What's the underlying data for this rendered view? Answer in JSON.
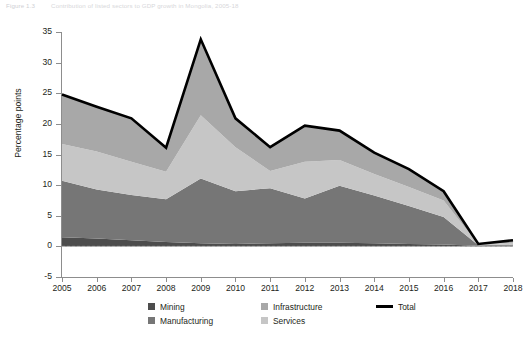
{
  "caption": {
    "number": "Figure 1.3",
    "text": "Contribution of listed sectors to GDP growth in Mongolia, 2005-18"
  },
  "chart_data": {
    "type": "area",
    "title": "",
    "subtitle": "",
    "xlabel": "",
    "ylabel": "Percentage points",
    "x": [
      2005,
      2006,
      2007,
      2008,
      2009,
      2010,
      2011,
      2012,
      2013,
      2014,
      2015,
      2016,
      2017,
      2018
    ],
    "categories": [
      "2005",
      "2006",
      "2007",
      "2008",
      "2009",
      "2010",
      "2011",
      "2012",
      "2013",
      "2014",
      "2015",
      "2016",
      "2017",
      "2018"
    ],
    "xlim": [
      2005,
      2018
    ],
    "ylim": [
      -5,
      35
    ],
    "yticks": [
      -5,
      0,
      5,
      10,
      15,
      20,
      25,
      30,
      35
    ],
    "grid": false,
    "stacked": true,
    "legend_position": "bottom",
    "series": [
      {
        "name": "Mining",
        "color": "#4d4d4d",
        "type": "area",
        "values": [
          1.5,
          1.3,
          1.0,
          0.7,
          0.5,
          0.4,
          0.5,
          0.6,
          0.6,
          0.5,
          0.4,
          0.3,
          0.1,
          0.1
        ]
      },
      {
        "name": "Manufacturing",
        "color": "#767676",
        "type": "area",
        "values": [
          9.2,
          8.0,
          7.4,
          7.0,
          10.6,
          8.6,
          9.0,
          7.2,
          9.3,
          7.8,
          6.2,
          4.5,
          0.1,
          0.2
        ]
      },
      {
        "name": "Services",
        "color": "#c6c6c6",
        "type": "area",
        "values": [
          6.0,
          6.2,
          5.4,
          4.5,
          10.3,
          7.2,
          2.8,
          6.0,
          4.2,
          3.5,
          3.1,
          2.7,
          0.1,
          0.3
        ]
      },
      {
        "name": "Infrastructure",
        "color": "#a8a8a8",
        "type": "area",
        "values": [
          8.1,
          7.3,
          7.1,
          3.9,
          12.4,
          4.7,
          3.9,
          5.9,
          4.8,
          3.5,
          2.9,
          1.5,
          0.1,
          0.4
        ]
      },
      {
        "name": "Total",
        "color": "#000000",
        "type": "line",
        "values": [
          24.8,
          22.8,
          20.9,
          16.1,
          33.8,
          20.9,
          16.2,
          19.7,
          18.9,
          15.3,
          12.6,
          9.0,
          0.4,
          1.0
        ]
      }
    ]
  },
  "legend": {
    "items": [
      {
        "label": "Mining",
        "swatch": "square",
        "color": "#4d4d4d"
      },
      {
        "label": "Manufacturing",
        "swatch": "square",
        "color": "#767676"
      },
      {
        "label": "Infrastructure",
        "swatch": "square",
        "color": "#a8a8a8"
      },
      {
        "label": "Services",
        "swatch": "square",
        "color": "#c6c6c6"
      },
      {
        "label": "Total",
        "swatch": "line",
        "color": "#000000"
      }
    ]
  }
}
